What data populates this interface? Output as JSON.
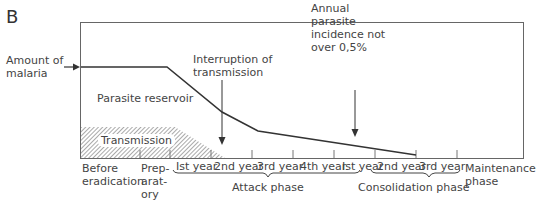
{
  "panel_label": "B",
  "y_label": [
    "Amount of",
    "malaria"
  ],
  "regions": {
    "reservoir": "Parasite reservoir",
    "transmission": "Transmission"
  },
  "annotations": {
    "interruption": [
      "Interruption of",
      "transmission"
    ],
    "incidence": [
      "Annual",
      "parasite",
      "incidence not",
      "over 0,5%"
    ]
  },
  "x_labels": {
    "before": [
      "Before",
      "eradication"
    ],
    "preparatory": [
      "Prep-",
      "arat-",
      "ory"
    ],
    "attack_years": [
      "Ist year",
      "2nd year",
      "3rd year",
      "4th year"
    ],
    "attack_phase": "Attack phase",
    "consolidation_years": [
      "Ist year",
      "2nd year",
      "3rd year"
    ],
    "consolidation_phase": "Consolidation phase",
    "maintenance": [
      "Maintenance",
      "phase"
    ]
  },
  "colors": {
    "line": "#333333",
    "hatch": "#555555"
  }
}
